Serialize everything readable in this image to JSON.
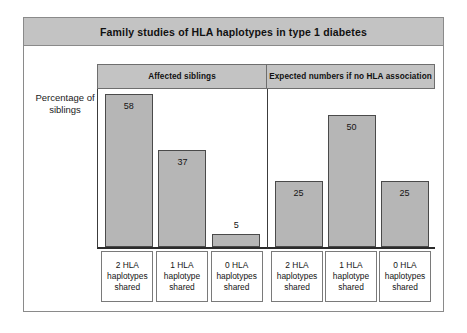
{
  "figure": {
    "title": "Family studies of HLA haplotypes in type 1 diabetes",
    "y_axis_label": "Percentage\nof siblings"
  },
  "chart_data": {
    "type": "bar",
    "title": "Family studies of HLA haplotypes in type 1 diabetes",
    "xlabel": "",
    "ylabel": "Percentage of siblings",
    "ylim": [
      0,
      60
    ],
    "grid": false,
    "legend": "none",
    "value_labels": true,
    "categories": [
      "2 HLA\nhaplotypes\nshared",
      "1 HLA\nhaplotype\nshared",
      "0 HLA\nhaplotypes\nshared"
    ],
    "panels": [
      {
        "header": "Affected siblings",
        "values": [
          58,
          37,
          5
        ],
        "categories": [
          "2 HLA\nhaplotypes\nshared",
          "1 HLA\nhaplotype\nshared",
          "0 HLA\nhaplotypes\nshared"
        ]
      },
      {
        "header": "Expected numbers if no HLA association",
        "values": [
          25,
          50,
          25
        ],
        "categories": [
          "2 HLA\nhaplotypes\nshared",
          "1 HLA\nhaplotype\nshared",
          "0 HLA\nhaplotypes\nshared"
        ]
      }
    ],
    "series": [
      {
        "name": "Affected siblings",
        "values": [
          58,
          37,
          5
        ]
      },
      {
        "name": "Expected numbers if no HLA association",
        "values": [
          25,
          50,
          25
        ]
      }
    ],
    "colors": {
      "bar_fill": "#b6b6b6",
      "bar_stroke": "#4a4a4a",
      "band_fill": "#c3c3c3",
      "frame": "#8a8a8a",
      "text": "#111111"
    }
  }
}
